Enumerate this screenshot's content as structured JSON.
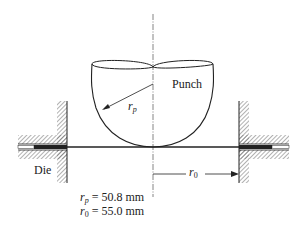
{
  "figure": {
    "labels": {
      "punch": "Punch",
      "die": "Die",
      "punch_radius_symbol": "r",
      "punch_radius_sub": "p",
      "blank_radius_symbol": "r",
      "blank_radius_sub": "0"
    },
    "parameters": [
      {
        "symbol": "r",
        "sub": "p",
        "eq": " = 50.8 mm"
      },
      {
        "symbol": "r",
        "sub": "0",
        "eq": " = 55.0 mm"
      }
    ],
    "colors": {
      "line": "#222222",
      "hatch": "#555555",
      "background": "#ffffff"
    }
  }
}
